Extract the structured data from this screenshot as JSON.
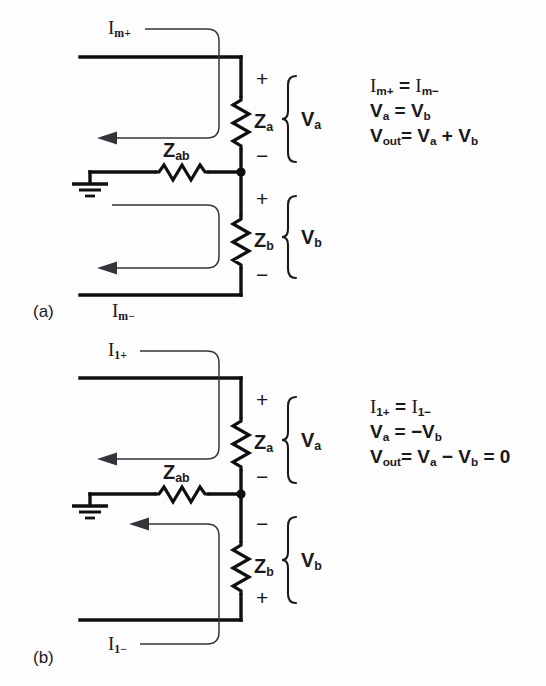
{
  "figure": {
    "type": "electrical-circuit-diagram",
    "background_color": "#fdfdfd",
    "ink_color": "#100f10",
    "panels": [
      {
        "id": "a",
        "caption": "(a)",
        "components": {
          "z_a": "Z",
          "z_a_sub": "a",
          "z_b": "Z",
          "z_b_sub": "b",
          "z_ab": "Z",
          "z_ab_sub": "ab"
        },
        "voltages": {
          "v_a": "V",
          "v_a_sub": "a",
          "v_b": "V",
          "v_b_sub": "b"
        },
        "currents": {
          "top": "I",
          "top_sub": "m+",
          "bottom": "I",
          "bottom_sub": "m−"
        },
        "polarity": {
          "za_top": "+",
          "za_bottom": "−",
          "zb_top": "+",
          "zb_bottom": "−"
        },
        "equations": [
          "I<sub>m+</sub> = I<sub>m−</sub>",
          "V<sub>a</sub> = V<sub>b</sub>",
          "V<sub>out</sub> = V<sub>a</sub> + V<sub>b</sub>"
        ],
        "equations_plain": [
          "Im+ = Im-",
          "Va = Vb",
          "Vout = Va + Vb"
        ]
      },
      {
        "id": "b",
        "caption": "(b)",
        "components": {
          "z_a": "Z",
          "z_a_sub": "a",
          "z_b": "Z",
          "z_b_sub": "b",
          "z_ab": "Z",
          "z_ab_sub": "ab"
        },
        "voltages": {
          "v_a": "V",
          "v_a_sub": "a",
          "v_b": "V",
          "v_b_sub": "b"
        },
        "currents": {
          "top": "I",
          "top_sub": "1+",
          "bottom": "I",
          "bottom_sub": "1−"
        },
        "polarity": {
          "za_top": "+",
          "za_bottom": "−",
          "zb_top": "−",
          "zb_bottom": "+"
        },
        "equations": [
          "I<sub>1+</sub> = I<sub>1−</sub>",
          "V<sub>a</sub> = −V<sub>b</sub>",
          "V<sub>out</sub> = V<sub>a</sub> − V<sub>b</sub> = 0"
        ],
        "equations_plain": [
          "I1+ = I1-",
          "Va = -Vb",
          "Vout = Va - Vb = 0"
        ]
      }
    ]
  }
}
